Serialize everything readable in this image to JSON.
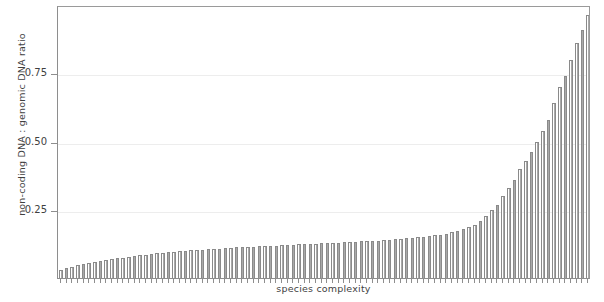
{
  "chart_data": {
    "type": "bar",
    "title": "",
    "subtitle": "",
    "xlabel": "species complexity",
    "ylabel": "non-coding DNA : genomic DNA ratio",
    "ylim": [
      0,
      1.0
    ],
    "ytick_labels": [
      "0.25",
      "0.50",
      "0.75"
    ],
    "ytick_values": [
      0.25,
      0.5,
      0.75
    ],
    "xtick_labels": [],
    "grid": true,
    "legend": null,
    "legend_position": "none",
    "bar_fill_color": "#ffffff",
    "bar_edge_color": "#8a8a8a",
    "axis_color": "#8e8e8e",
    "grid_color": "#ededed",
    "text_color": "#3f3f3f",
    "n_bars": 94,
    "categories": [
      "1",
      "2",
      "3",
      "4",
      "5",
      "6",
      "7",
      "8",
      "9",
      "10",
      "11",
      "12",
      "13",
      "14",
      "15",
      "16",
      "17",
      "18",
      "19",
      "20",
      "21",
      "22",
      "23",
      "24",
      "25",
      "26",
      "27",
      "28",
      "29",
      "30",
      "31",
      "32",
      "33",
      "34",
      "35",
      "36",
      "37",
      "38",
      "39",
      "40",
      "41",
      "42",
      "43",
      "44",
      "45",
      "46",
      "47",
      "48",
      "49",
      "50",
      "51",
      "52",
      "53",
      "54",
      "55",
      "56",
      "57",
      "58",
      "59",
      "60",
      "61",
      "62",
      "63",
      "64",
      "65",
      "66",
      "67",
      "68",
      "69",
      "70",
      "71",
      "72",
      "73",
      "74",
      "75",
      "76",
      "77",
      "78",
      "79",
      "80",
      "81",
      "82",
      "83",
      "84",
      "85",
      "86",
      "87",
      "88",
      "89",
      "90",
      "91",
      "92",
      "93",
      "94"
    ],
    "values": [
      0.03,
      0.035,
      0.041,
      0.046,
      0.05,
      0.055,
      0.059,
      0.062,
      0.066,
      0.069,
      0.072,
      0.075,
      0.078,
      0.081,
      0.083,
      0.086,
      0.088,
      0.09,
      0.092,
      0.094,
      0.096,
      0.098,
      0.1,
      0.101,
      0.103,
      0.104,
      0.106,
      0.107,
      0.108,
      0.11,
      0.111,
      0.112,
      0.113,
      0.114,
      0.115,
      0.116,
      0.117,
      0.118,
      0.119,
      0.12,
      0.121,
      0.122,
      0.123,
      0.124,
      0.125,
      0.126,
      0.127,
      0.128,
      0.129,
      0.13,
      0.131,
      0.132,
      0.133,
      0.134,
      0.135,
      0.136,
      0.137,
      0.139,
      0.14,
      0.142,
      0.143,
      0.145,
      0.147,
      0.149,
      0.151,
      0.153,
      0.156,
      0.159,
      0.163,
      0.167,
      0.172,
      0.178,
      0.186,
      0.196,
      0.21,
      0.228,
      0.248,
      0.268,
      0.3,
      0.33,
      0.36,
      0.4,
      0.43,
      0.46,
      0.5,
      0.54,
      0.58,
      0.64,
      0.7,
      0.74,
      0.8,
      0.86,
      0.91,
      0.965
    ]
  }
}
